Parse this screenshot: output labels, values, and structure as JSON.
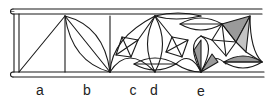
{
  "figure": {
    "type": "construction-diagram",
    "colors": {
      "line": "#1a1a1a",
      "shade": "#9a9a9a",
      "background": "#ffffff"
    },
    "labels": [
      {
        "id": "a",
        "text": "a",
        "x": 40
      },
      {
        "id": "b",
        "text": "b",
        "x": 87
      },
      {
        "id": "c",
        "text": "c",
        "x": 133
      },
      {
        "id": "d",
        "text": "d",
        "x": 154
      },
      {
        "id": "e",
        "text": "e",
        "x": 201
      }
    ],
    "steps": [
      {
        "label": "a",
        "content": "rectangle divided by a diagonal"
      },
      {
        "label": "b",
        "content": "diagonal with two intersecting arcs forming a vesica"
      },
      {
        "label": "c",
        "content": "arcs from the base forming a semicircular curve"
      },
      {
        "label": "d",
        "content": "rosette with kite-shaped facets and lens shapes"
      },
      {
        "label": "e",
        "content": "completed pattern with shaded facets"
      }
    ]
  }
}
